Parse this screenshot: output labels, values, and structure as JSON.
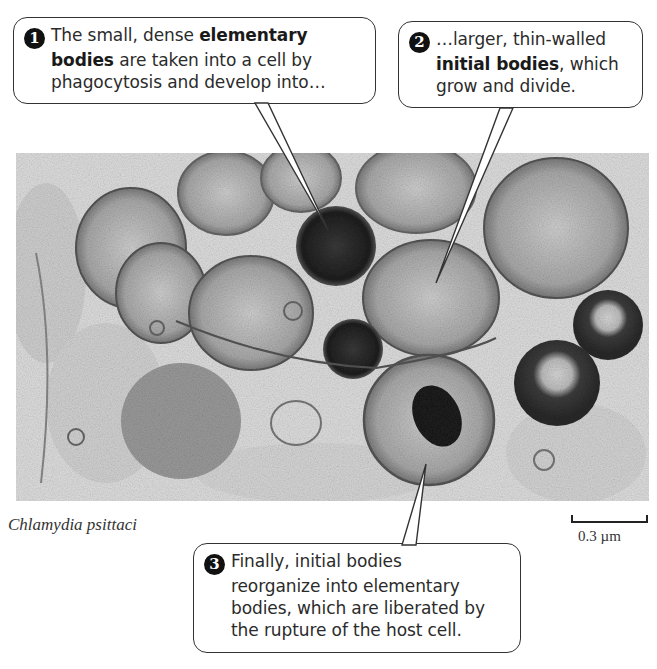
{
  "figure": {
    "caption": "Chlamydia psittaci",
    "scale_bar": {
      "label": "0.3 µm"
    }
  },
  "callouts": [
    {
      "number": "1",
      "text_parts": [
        {
          "text": "The small, dense ",
          "bold": false
        },
        {
          "text": "elementary bodies",
          "bold": true
        },
        {
          "text": " are taken into a cell by phagocytosis and develop into…",
          "bold": false
        }
      ],
      "lines": [
        "The small, dense elementary",
        "bodies are taken into a cell by",
        "phagocytosis and develop into…"
      ]
    },
    {
      "number": "2",
      "text_parts": [
        {
          "text": "…larger, thin-walled ",
          "bold": false
        },
        {
          "text": "initial bodies",
          "bold": true
        },
        {
          "text": ", which grow and divide.",
          "bold": false
        }
      ],
      "lines": [
        "…larger, thin-walled",
        "initial bodies, which",
        "grow and divide."
      ]
    },
    {
      "number": "3",
      "text_parts": [
        {
          "text": "Finally, initial bodies reorganize into elementary bodies, which are liberated by the rupture of the host cell.",
          "bold": false
        }
      ],
      "lines": [
        "Finally, initial bodies",
        "reorganize into elementary",
        "bodies, which are liberated by",
        "the rupture of the host cell."
      ]
    }
  ],
  "colors": {
    "background": "#ffffff",
    "micrograph_base": "#e4e4e4",
    "dense_body": "#222222",
    "initial_body": "#a8a8a8",
    "outline": "#333333"
  }
}
